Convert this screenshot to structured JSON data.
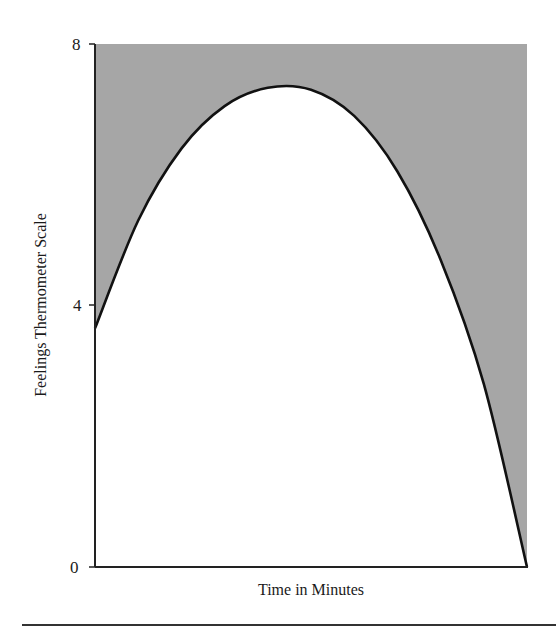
{
  "chart_data": {
    "type": "area",
    "title": "",
    "xlabel": "Time in Minutes",
    "ylabel": "Feelings Thermometer Scale",
    "ylim": [
      0,
      8
    ],
    "yticks": [
      0,
      4,
      8
    ],
    "xticks": [],
    "grid": false,
    "legend": null,
    "fill": "region above curve shaded gray up to y=8",
    "x": [
      0,
      0.1,
      0.2,
      0.3,
      0.4,
      0.5,
      0.6,
      0.7,
      0.8,
      0.9,
      1.0
    ],
    "series": [
      {
        "name": "Feelings curve",
        "values": [
          3.65,
          5.3,
          6.4,
          7.05,
          7.33,
          7.3,
          6.9,
          6.05,
          4.7,
          2.8,
          0.0
        ]
      }
    ]
  },
  "axes": {
    "y_ticks": [
      {
        "label": "8"
      },
      {
        "label": "4"
      },
      {
        "label": "0"
      }
    ],
    "x_title": "Time in Minutes",
    "y_title": "Feelings Thermometer Scale"
  },
  "colors": {
    "fill": "#a6a6a6",
    "curve": "#111111",
    "axis": "#222222"
  }
}
